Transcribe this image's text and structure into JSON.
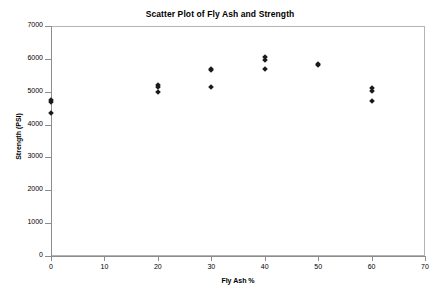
{
  "chart_data": {
    "type": "scatter",
    "title": "Scatter Plot of Fly Ash and Strength",
    "xlabel": "Fly Ash %",
    "ylabel": "Strength (PSI)",
    "xlim": [
      0,
      70
    ],
    "ylim": [
      0,
      7000
    ],
    "xticks": [
      0,
      10,
      20,
      30,
      40,
      50,
      60,
      70
    ],
    "yticks": [
      0,
      1000,
      2000,
      3000,
      4000,
      5000,
      6000,
      7000
    ],
    "xtick_labels": [
      "0",
      "10",
      "20",
      "30",
      "40",
      "50",
      "60",
      "70"
    ],
    "ytick_labels": [
      "0",
      "1000",
      "2000",
      "3000",
      "4000",
      "5000",
      "6000",
      "7000"
    ],
    "grid": false,
    "legend": false,
    "marker_shape": "diamond",
    "marker_color": "#1a1a1a",
    "series": [
      {
        "name": "Fly Ash vs Strength",
        "points": [
          {
            "x": 0,
            "y": 4750
          },
          {
            "x": 0,
            "y": 4690
          },
          {
            "x": 0,
            "y": 4350
          },
          {
            "x": 20,
            "y": 5200
          },
          {
            "x": 20,
            "y": 5140
          },
          {
            "x": 20,
            "y": 5000
          },
          {
            "x": 30,
            "y": 5700
          },
          {
            "x": 30,
            "y": 5650
          },
          {
            "x": 30,
            "y": 5150
          },
          {
            "x": 40,
            "y": 6050
          },
          {
            "x": 40,
            "y": 5960
          },
          {
            "x": 40,
            "y": 5700
          },
          {
            "x": 50,
            "y": 5850
          },
          {
            "x": 50,
            "y": 5800
          },
          {
            "x": 60,
            "y": 5100
          },
          {
            "x": 60,
            "y": 5010
          },
          {
            "x": 60,
            "y": 4720
          }
        ]
      }
    ]
  }
}
